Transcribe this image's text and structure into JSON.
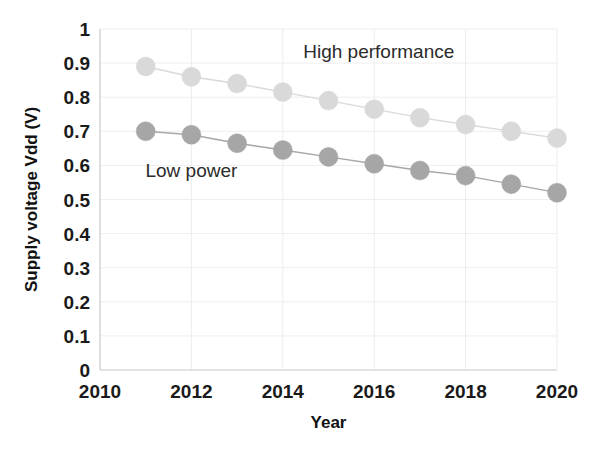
{
  "chart_data": {
    "type": "line",
    "title": "",
    "xlabel": "Year",
    "ylabel": "Supply voltage Vdd (V)",
    "xlim": [
      2010,
      2020
    ],
    "ylim": [
      0,
      1
    ],
    "grid": true,
    "legend_position": "inline-annotation",
    "x": [
      2011,
      2012,
      2013,
      2014,
      2015,
      2016,
      2017,
      2018,
      2019,
      2020
    ],
    "xticks": [
      "2010",
      "2012",
      "2014",
      "2016",
      "2018",
      "2020"
    ],
    "xtick_values": [
      2010,
      2012,
      2014,
      2016,
      2018,
      2020
    ],
    "yticks": [
      "0",
      "0.1",
      "0.2",
      "0.3",
      "0.4",
      "0.5",
      "0.6",
      "0.7",
      "0.8",
      "0.9",
      "1"
    ],
    "ytick_values": [
      0,
      0.1,
      0.2,
      0.3,
      0.4,
      0.5,
      0.6,
      0.7,
      0.8,
      0.9,
      1
    ],
    "series": [
      {
        "name": "High performance",
        "color": "#d9d9d9",
        "marker": "circle",
        "values": [
          0.89,
          0.86,
          0.84,
          0.815,
          0.79,
          0.765,
          0.74,
          0.72,
          0.7,
          0.68
        ]
      },
      {
        "name": "Low power",
        "color": "#a6a6a6",
        "marker": "circle",
        "values": [
          0.7,
          0.69,
          0.665,
          0.645,
          0.625,
          0.605,
          0.585,
          0.57,
          0.545,
          0.52
        ]
      }
    ],
    "annotations": [
      {
        "text": "High performance",
        "x": 2016.1,
        "y": 0.915
      },
      {
        "text": "Low power",
        "x": 2012.0,
        "y": 0.565
      }
    ]
  }
}
